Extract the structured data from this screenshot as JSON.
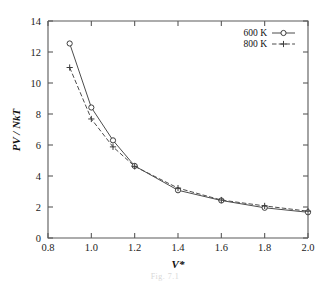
{
  "figure": {
    "caption": "Fig. 7.1"
  },
  "chart_data": {
    "type": "line",
    "title": "",
    "xlabel": "V*",
    "ylabel": "PV / NkT",
    "xlim": [
      0.8,
      2.0
    ],
    "ylim": [
      0,
      14
    ],
    "xticks": [
      "0.8",
      "1.0",
      "1.2",
      "1.4",
      "1.6",
      "1.8",
      "2.0"
    ],
    "xtick_values": [
      0.8,
      1.0,
      1.2,
      1.4,
      1.6,
      1.8,
      2.0
    ],
    "yticks": [
      "0",
      "2",
      "4",
      "6",
      "8",
      "10",
      "12",
      "14"
    ],
    "ytick_values": [
      0,
      2,
      4,
      6,
      8,
      10,
      12,
      14
    ],
    "grid": false,
    "legend_position": "top-right",
    "series": [
      {
        "name": "600 K",
        "marker": "circle",
        "linestyle": "solid",
        "color": "#3d3d3d",
        "x": [
          0.9,
          1.0,
          1.1,
          1.2,
          1.4,
          1.6,
          1.8,
          2.0
        ],
        "values": [
          12.55,
          8.42,
          6.3,
          4.65,
          3.08,
          2.42,
          1.95,
          1.66
        ]
      },
      {
        "name": "800 K",
        "marker": "plus",
        "linestyle": "dashed",
        "color": "#3d3d3d",
        "x": [
          0.9,
          1.0,
          1.1,
          1.2,
          1.4,
          1.6,
          1.8,
          2.0
        ],
        "values": [
          11.0,
          7.68,
          5.88,
          4.62,
          3.22,
          2.45,
          2.07,
          1.73
        ]
      }
    ]
  }
}
